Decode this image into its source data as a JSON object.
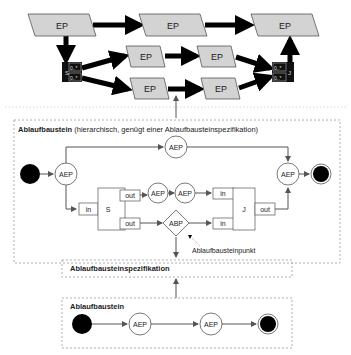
{
  "top_network": {
    "node_label": "EP",
    "split_label": "S",
    "join_label": "J",
    "multiplicity": "0..*"
  },
  "hier_block": {
    "title_bold": "Ablaufbaustein",
    "title_rest": " (hierarchisch, genügt einer Ablaufbausteinspezifikation)",
    "aep": "AEP",
    "abp": "ABP",
    "split": "S",
    "join": "J",
    "port_in": "in",
    "port_out": "out"
  },
  "annotation": {
    "ablaufbausteinpunkt": "Ablaufbausteinpunkt"
  },
  "spec_block": {
    "title": "Ablaufbausteinspezifikation"
  },
  "simple_block": {
    "title": "Ablaufbaustein",
    "aep": "AEP"
  },
  "colors": {
    "ep_fill": "#d3d3d3",
    "line": "#000000",
    "dashed": "#999999",
    "arrow": "#555555"
  }
}
